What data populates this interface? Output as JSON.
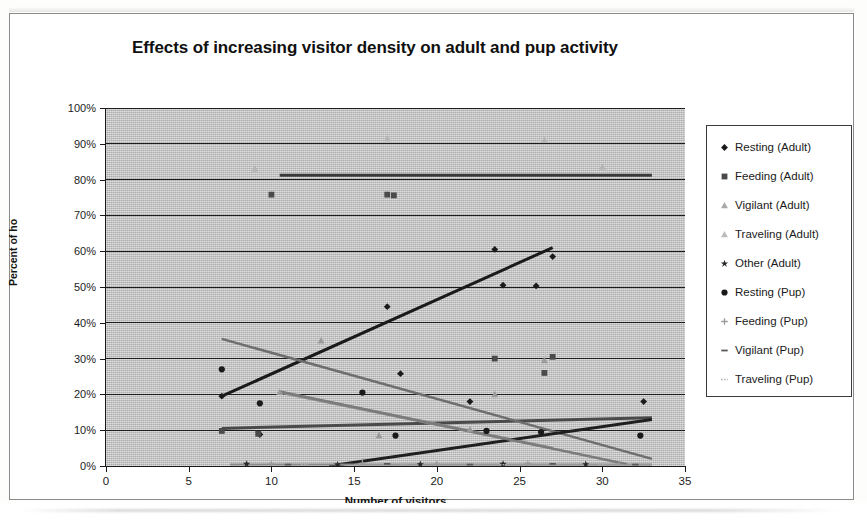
{
  "chart_data": {
    "type": "scatter",
    "title": "Effects of increasing visitor density on adult and pup activity",
    "xlabel": "Number of visitors",
    "ylabel": "Percent of ho",
    "xlim": [
      0,
      35
    ],
    "ylim": [
      0,
      1.0
    ],
    "x_ticks": [
      "0",
      "5",
      "10",
      "15",
      "20",
      "25",
      "30",
      "35"
    ],
    "x_tick_values": [
      0,
      5,
      10,
      15,
      20,
      25,
      30,
      35
    ],
    "y_ticks": [
      "0%",
      "10%",
      "20%",
      "30%",
      "40%",
      "50%",
      "60%",
      "70%",
      "80%",
      "90%",
      "100%"
    ],
    "y_tick_values": [
      0,
      10,
      20,
      30,
      40,
      50,
      60,
      70,
      80,
      90,
      100
    ],
    "grid": true,
    "grid_axis": "y",
    "legend_position": "right",
    "plot_background": "#c2c2c2",
    "series": [
      {
        "name": "Resting (Adult)",
        "marker": "diamond",
        "color": "#1a1a1a",
        "points": [
          [
            7,
            19.5
          ],
          [
            9.3,
            8.8
          ],
          [
            17,
            44.5
          ],
          [
            17.8,
            25.8
          ],
          [
            22,
            18.0
          ],
          [
            23.5,
            60.5
          ],
          [
            24,
            50.5
          ],
          [
            26,
            50.3
          ],
          [
            27,
            58.5
          ],
          [
            32.5,
            18.0
          ]
        ],
        "trendline": {
          "x0": 7,
          "y0": 19.5,
          "x1": 27,
          "y1": 61.0,
          "color": "#1a1a1a",
          "width": 3
        }
      },
      {
        "name": "Feeding (Adult)",
        "marker": "square",
        "color": "#4a4a4a",
        "points": [
          [
            7,
            9.8
          ],
          [
            9.2,
            9.0
          ],
          [
            17,
            75.8
          ],
          [
            17.4,
            75.6
          ],
          [
            23.5,
            30.0
          ],
          [
            26.5,
            26.0
          ],
          [
            27,
            30.5
          ],
          [
            10,
            75.8
          ]
        ],
        "trendline": {
          "x0": 7,
          "y0": 10.5,
          "x1": 33,
          "y1": 13.5,
          "color": "#4a4a4a",
          "width": 3
        }
      },
      {
        "name": "Vigilant (Adult)",
        "marker": "triangle",
        "color": "#9a9a9a",
        "points": [
          [
            10.5,
            20.6
          ],
          [
            13,
            35.0
          ],
          [
            16.5,
            8.5
          ],
          [
            22,
            10.2
          ],
          [
            23.5,
            20.0
          ],
          [
            26.5,
            29.5
          ]
        ],
        "trendline": {
          "x0": 10.5,
          "y0": 20.6,
          "x1": 27,
          "y1": 5.0,
          "color": "#8f8f8f",
          "width": 3
        }
      },
      {
        "name": "Traveling (Adult)",
        "marker": "triangle-light",
        "color": "#b4b4b4",
        "points": [
          [
            9,
            83.0
          ],
          [
            17,
            91.5
          ],
          [
            26.5,
            91.0
          ],
          [
            30,
            83.5
          ]
        ],
        "trendline": {
          "x0": 7,
          "y0": 35.5,
          "x1": 33,
          "y1": 2.0,
          "color": "#6e6e6e",
          "width": 2.5
        }
      },
      {
        "name": "Other (Adult)",
        "marker": "star",
        "color": "#2a2a2a",
        "points": [
          [
            8.5,
            0.6
          ],
          [
            14,
            0.4
          ],
          [
            19,
            0.5
          ],
          [
            24,
            0.6
          ],
          [
            29,
            0.5
          ]
        ],
        "trendline": {
          "x0": 10.5,
          "y0": 81.2,
          "x1": 33,
          "y1": 81.2,
          "color": "#3a3a3a",
          "width": 3
        }
      },
      {
        "name": "Resting (Pup)",
        "marker": "circle",
        "color": "#1a1a1a",
        "points": [
          [
            7,
            27.0
          ],
          [
            9.3,
            17.5
          ],
          [
            15.5,
            20.5
          ],
          [
            17.5,
            8.5
          ],
          [
            23,
            9.8
          ],
          [
            26.3,
            9.5
          ],
          [
            32.3,
            8.5
          ]
        ],
        "trendline": {
          "x0": 13.5,
          "y0": 0.0,
          "x1": 33,
          "y1": 13.0,
          "color": "#1f1f1f",
          "width": 3
        }
      },
      {
        "name": "Feeding (Pup)",
        "marker": "plus",
        "color": "#9a9a9a",
        "points": [
          [
            10,
            0.6
          ],
          [
            15.5,
            0.8
          ],
          [
            20,
            0.5
          ],
          [
            25.5,
            0.7
          ],
          [
            31,
            0.5
          ]
        ],
        "trendline": {
          "x0": 7.5,
          "y0": 0.4,
          "x1": 33,
          "y1": 0.4,
          "color": "#8a8a8a",
          "width": 2
        }
      },
      {
        "name": "Vigilant (Pup)",
        "marker": "dash",
        "color": "#5a5a5a",
        "points": [
          [
            11,
            0.4
          ],
          [
            17,
            0.6
          ],
          [
            22,
            0.4
          ],
          [
            27,
            0.6
          ],
          [
            32,
            0.4
          ]
        ],
        "trendline": {
          "x0": 10.5,
          "y0": 20.8,
          "x1": 31.5,
          "y1": 0.5,
          "color": "#7b7b7b",
          "width": 2.5
        }
      },
      {
        "name": "Traveling (Pup)",
        "marker": "dotted",
        "color": "#b0b0b0",
        "points": [
          [
            12,
            0.4
          ],
          [
            18,
            0.5
          ],
          [
            24,
            0.4
          ],
          [
            30,
            0.5
          ]
        ],
        "trendline": {
          "x0": 15,
          "y0": 0.2,
          "x1": 33,
          "y1": 0.2,
          "color": "#a5a5a5",
          "width": 1.5
        }
      }
    ]
  },
  "legend": {
    "items": [
      {
        "label": "Resting (Adult)",
        "marker": "diamond",
        "color": "#1a1a1a"
      },
      {
        "label": "Feeding (Adult)",
        "marker": "square",
        "color": "#4a4a4a"
      },
      {
        "label": "Vigilant (Adult)",
        "marker": "triangle",
        "color": "#a8a8a8"
      },
      {
        "label": "Traveling (Adult)",
        "marker": "triangle-light",
        "color": "#bcbcbc"
      },
      {
        "label": "Other (Adult)",
        "marker": "star",
        "color": "#2a2a2a"
      },
      {
        "label": "Resting (Pup)",
        "marker": "circle",
        "color": "#1a1a1a"
      },
      {
        "label": "Feeding (Pup)",
        "marker": "plus",
        "color": "#9a9a9a"
      },
      {
        "label": "Vigilant (Pup)",
        "marker": "dash",
        "color": "#5a5a5a"
      },
      {
        "label": "Traveling (Pup)",
        "marker": "dotted",
        "color": "#b0b0b0"
      }
    ]
  }
}
